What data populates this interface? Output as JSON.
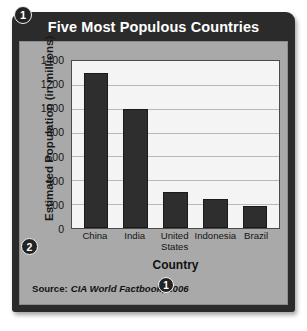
{
  "figure": {
    "title": "Five Most Populous Countries",
    "source_label": "Source:",
    "source_text": "CIA World Factbook, 2006",
    "callouts": {
      "title_badge": "1",
      "yaxis_badge": "2",
      "source_badge": "1"
    },
    "colors": {
      "frame": "#2b2b2b",
      "panel": "#a9a9a9",
      "plot_background": "#f4f4f4",
      "bar": "#2e2e2e",
      "gridline": "#b9b9b9",
      "title_text": "#ffffff"
    }
  },
  "chart_data": {
    "type": "bar",
    "title": "Five Most Populous Countries",
    "xlabel": "Country",
    "ylabel": "Estimated Population (in millions)",
    "categories": [
      "China",
      "India",
      "United States",
      "Indonesia",
      "Brazil"
    ],
    "category_lines": [
      [
        "China"
      ],
      [
        "India"
      ],
      [
        "United",
        "States"
      ],
      [
        "Indonesia"
      ],
      [
        "Brazil"
      ]
    ],
    "values": [
      1300,
      1000,
      300,
      245,
      185
    ],
    "ylim": [
      0,
      1400
    ],
    "yticks": [
      0,
      200,
      400,
      600,
      800,
      1000,
      1200,
      1400
    ],
    "ytick_labels": [
      "0",
      "200",
      "400",
      "600",
      "800",
      "1000",
      "1200",
      "1400"
    ],
    "grid": true,
    "legend": false,
    "source": "Source: CIA World Factbook, 2006"
  }
}
